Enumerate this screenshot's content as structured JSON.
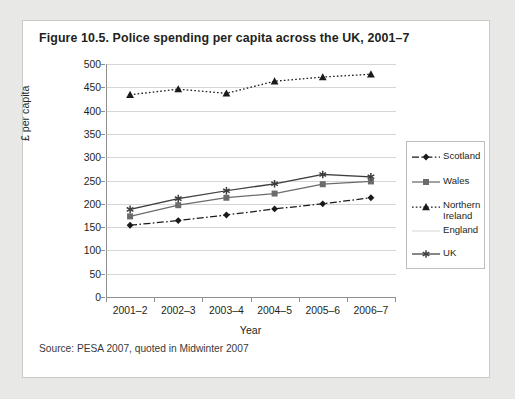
{
  "figure": {
    "title": "Figure 10.5. Police spending per capita across the UK, 2001–7",
    "source": "Source: PESA 2007, quoted in Midwinter 2007"
  },
  "chart_data": {
    "type": "line",
    "title": "Figure 10.5. Police spending per capita across the UK, 2001–7",
    "xlabel": "Year",
    "ylabel": "£ per capita",
    "categories": [
      "2001–2",
      "2002–3",
      "2003–4",
      "2004–5",
      "2005–6",
      "2006–7"
    ],
    "ylim": [
      0,
      500
    ],
    "ytick_values": [
      0,
      50,
      100,
      150,
      200,
      250,
      300,
      350,
      400,
      450,
      500
    ],
    "ytick_labels": [
      "0",
      "50",
      "100",
      "150",
      "200",
      "250",
      "300",
      "350",
      "400",
      "450",
      "500"
    ],
    "grid": true,
    "legend_position": "right",
    "series": [
      {
        "name": "Scotland",
        "marker": "diamond",
        "line_style": "dash-dot",
        "color": "#1a1a1a",
        "values": [
          154,
          164,
          176,
          189,
          200,
          213
        ]
      },
      {
        "name": "Wales",
        "marker": "square",
        "line_style": "solid",
        "color": "#6b6b6b",
        "values": [
          173,
          197,
          213,
          222,
          242,
          248
        ]
      },
      {
        "name": "Northern Ireland",
        "marker": "triangle",
        "line_style": "dotted",
        "color": "#1a1a1a",
        "values": [
          434,
          446,
          437,
          463,
          472,
          478
        ]
      },
      {
        "name": "England",
        "marker": "none",
        "line_style": "solid",
        "color": "#dedede",
        "values": [
          188,
          211,
          228,
          243,
          262,
          257
        ]
      },
      {
        "name": "UK",
        "marker": "asterisk",
        "line_style": "solid",
        "color": "#3d3d3d",
        "values": [
          188,
          211,
          228,
          243,
          263,
          258
        ]
      }
    ]
  },
  "legend": {
    "entries": [
      {
        "label": "Scotland"
      },
      {
        "label": "Wales"
      },
      {
        "label_line1": "Northern",
        "label_line2": "Ireland"
      },
      {
        "label": "England"
      },
      {
        "label": "UK"
      }
    ]
  }
}
